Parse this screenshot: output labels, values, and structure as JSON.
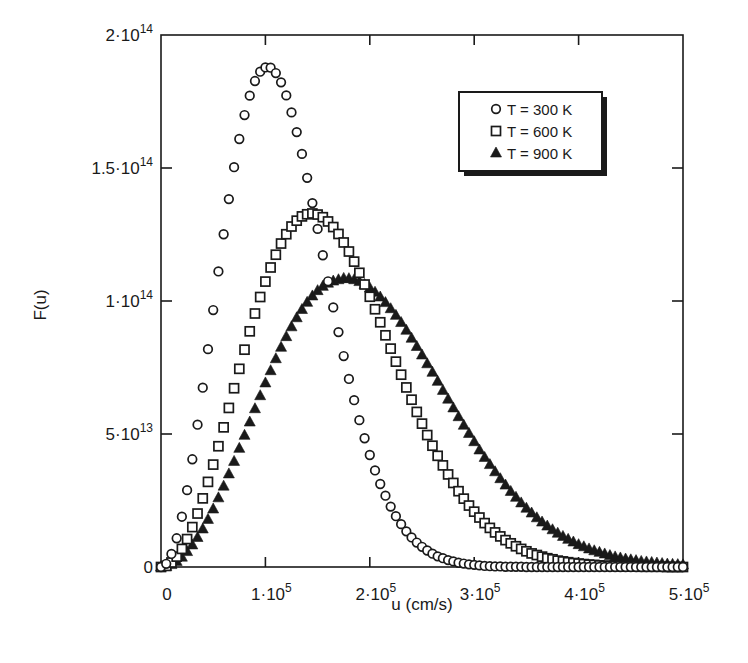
{
  "chart_data": {
    "type": "scatter",
    "title": "",
    "xlabel": "u (cm/s)",
    "ylabel": "F(u)",
    "xlim": [
      0,
      500000
    ],
    "ylim": [
      0,
      200000000000000
    ],
    "grid": false,
    "legend_position": "upper right (inside)",
    "x_ticks": [
      {
        "value": 0,
        "label": "0",
        "sup": ""
      },
      {
        "value": 100000,
        "label": "1·10",
        "sup": "5"
      },
      {
        "value": 200000,
        "label": "2·10",
        "sup": "5"
      },
      {
        "value": 300000,
        "label": "3·10",
        "sup": "5"
      },
      {
        "value": 400000,
        "label": "4·10",
        "sup": "5"
      },
      {
        "value": 500000,
        "label": "5·10",
        "sup": "5"
      }
    ],
    "y_ticks": [
      {
        "value": 0,
        "label": "0",
        "sup": ""
      },
      {
        "value": 50000000000000,
        "label": "5·10",
        "sup": "13"
      },
      {
        "value": 100000000000000,
        "label": "1·10",
        "sup": "14"
      },
      {
        "value": 150000000000000,
        "label": "1.5·10",
        "sup": "14"
      },
      {
        "value": 200000000000000,
        "label": "2·10",
        "sup": "14"
      }
    ],
    "x_step": 5000,
    "y_unit": 1000000000000,
    "series": [
      {
        "name": "T = 300 K",
        "marker": "circle-open",
        "values": [
          0,
          1.2,
          4.9,
          10.8,
          18.9,
          28.9,
          40.5,
          53.5,
          67.4,
          81.9,
          96.6,
          111.1,
          125.1,
          138.3,
          150.3,
          160.9,
          169.9,
          177.2,
          182.7,
          186.2,
          187.8,
          187.7,
          185.7,
          182.2,
          177.3,
          170.9,
          163.5,
          155.3,
          146.3,
          136.8,
          127.1,
          117.2,
          107.4,
          97.6,
          88.3,
          79.3,
          70.7,
          62.7,
          55.2,
          48.4,
          42.1,
          36.3,
          31.2,
          26.8,
          22.7,
          19.1,
          16.1,
          13.4,
          11.1,
          9.2,
          7.6,
          6.2,
          5.0,
          4.0,
          3.3,
          2.6,
          2.1,
          1.6,
          1.3,
          1.0,
          0.8,
          0.6,
          0.4,
          0.3,
          0.2,
          0.2,
          0.1,
          0.1,
          0.1,
          0.1,
          0,
          0,
          0,
          0,
          0,
          0,
          0,
          0,
          0,
          0,
          0,
          0,
          0,
          0,
          0,
          0,
          0,
          0,
          0,
          0,
          0,
          0,
          0,
          0,
          0,
          0,
          0,
          0,
          0,
          0,
          0
        ]
      },
      {
        "name": "T = 600 K",
        "marker": "square-open",
        "values": [
          0,
          0.4,
          1.7,
          3.9,
          6.8,
          10.5,
          15.0,
          20.1,
          25.8,
          32.0,
          38.5,
          45.4,
          52.5,
          59.8,
          67.2,
          74.5,
          81.7,
          88.6,
          95.3,
          101.5,
          107.3,
          112.6,
          117.4,
          121.6,
          125.1,
          128.0,
          130.2,
          131.8,
          132.6,
          132.9,
          132.5,
          131.5,
          129.9,
          127.8,
          125.2,
          122.0,
          118.6,
          114.8,
          110.6,
          106.2,
          101.6,
          96.9,
          92.0,
          87.1,
          82.1,
          77.2,
          72.3,
          67.5,
          62.9,
          58.3,
          53.9,
          49.6,
          45.6,
          41.8,
          38.2,
          34.8,
          31.6,
          28.5,
          25.7,
          23.1,
          20.8,
          18.6,
          16.5,
          14.7,
          13.0,
          11.5,
          10.1,
          8.9,
          7.8,
          6.8,
          5.9,
          5.1,
          4.5,
          3.9,
          3.3,
          2.9,
          2.4,
          2.1,
          1.8,
          1.5,
          1.3,
          1.1,
          0.9,
          0.8,
          0.6,
          0.5,
          0.4,
          0.4,
          0.3,
          0.2,
          0.2,
          0.2,
          0.1,
          0.1,
          0.1,
          0.1,
          0.1,
          0,
          0,
          0,
          0
        ]
      },
      {
        "name": "T = 900 K",
        "marker": "triangle-filled",
        "values": [
          0,
          0.2,
          0.9,
          2.1,
          3.7,
          5.8,
          8.3,
          11.1,
          14.3,
          17.9,
          21.8,
          26.0,
          30.4,
          35.0,
          39.7,
          44.6,
          49.5,
          54.5,
          59.5,
          64.4,
          69.2,
          73.8,
          78.3,
          82.6,
          86.6,
          90.3,
          93.7,
          96.8,
          99.5,
          101.9,
          103.9,
          105.5,
          106.7,
          107.5,
          108.0,
          108.5,
          108.4,
          108.0,
          107.3,
          106.2,
          104.9,
          103.3,
          101.5,
          99.4,
          97.1,
          94.6,
          91.9,
          89.0,
          86.0,
          82.9,
          79.7,
          76.4,
          73.2,
          69.8,
          66.4,
          63.1,
          59.8,
          56.5,
          53.3,
          50.2,
          47.1,
          44.0,
          41.2,
          38.5,
          35.8,
          33.2,
          30.8,
          28.4,
          26.2,
          24.1,
          22.1,
          20.3,
          18.5,
          16.9,
          15.4,
          14.0,
          12.7,
          11.5,
          10.4,
          9.4,
          8.4,
          7.6,
          6.8,
          6.1,
          5.5,
          4.9,
          4.3,
          3.8,
          3.4,
          3.0,
          2.7,
          2.4,
          2.1,
          1.9,
          1.7,
          1.5,
          1.3,
          1.1,
          1.0,
          0.9,
          0.8
        ]
      }
    ]
  },
  "legend": {
    "items": [
      {
        "label": "T = 300 K",
        "marker": "circle-open"
      },
      {
        "label": "T = 600 K",
        "marker": "square-open"
      },
      {
        "label": "T = 900 K",
        "marker": "triangle-filled"
      }
    ]
  },
  "axes": {
    "xlabel": "u (cm/s)",
    "ylabel": "F(u)"
  },
  "style": {
    "ink": "#1a1a1a",
    "background": "#ffffff"
  }
}
